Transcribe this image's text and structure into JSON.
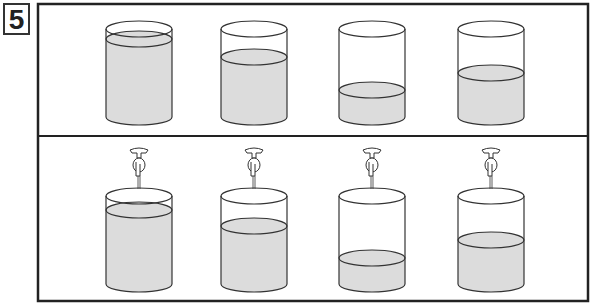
{
  "problem_number": "5",
  "colors": {
    "stroke": "#333333",
    "water": "#dcdcdc",
    "frame": "#222222"
  },
  "frame": {
    "x": 38,
    "y": 4,
    "w": 550,
    "h": 297,
    "divider_y": 136
  },
  "cylinder": {
    "rx": 33,
    "ry": 8
  },
  "top_row": [
    {
      "cx": 139,
      "top": 29,
      "bottom": 117,
      "water": 39
    },
    {
      "cx": 254,
      "top": 29,
      "bottom": 117,
      "water": 57
    },
    {
      "cx": 372,
      "top": 29,
      "bottom": 117,
      "water": 90
    },
    {
      "cx": 491,
      "top": 29,
      "bottom": 117,
      "water": 73
    }
  ],
  "bottom_row": [
    {
      "cx": 139,
      "top": 196,
      "bottom": 284,
      "water": 210,
      "faucet": true
    },
    {
      "cx": 254,
      "top": 196,
      "bottom": 284,
      "water": 226,
      "faucet": true
    },
    {
      "cx": 372,
      "top": 196,
      "bottom": 284,
      "water": 258,
      "faucet": true
    },
    {
      "cx": 491,
      "top": 196,
      "bottom": 284,
      "water": 240,
      "faucet": true
    }
  ]
}
